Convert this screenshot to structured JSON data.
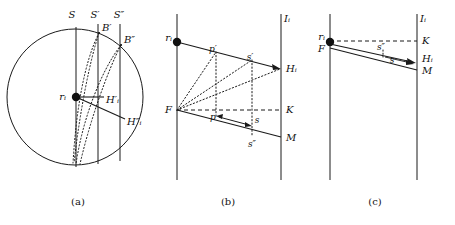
{
  "figure": {
    "background": "#ffffff",
    "stroke": "#1a1a1a",
    "panels": [
      {
        "id": "a",
        "caption": "(a)",
        "labels": {
          "center_point": "rᵢ",
          "line_S": "S",
          "line_S_prime": "S′",
          "line_S_double_prime": "S″",
          "point_B_prime": "B′",
          "point_B_double_prime": "B″",
          "point_H_prime": "H′ᵢ",
          "point_H_double_prime": "H″ᵢ"
        }
      },
      {
        "id": "b",
        "caption": "(b)",
        "labels": {
          "source_point": "rᵢ",
          "line_I": "Iᵢ",
          "point_F": "F",
          "point_K": "K",
          "point_M": "M",
          "point_H": "Hᵢ",
          "seg_p_prime": "p′",
          "seg_s_prime": "s′",
          "seg_p": "p",
          "seg_s": "s",
          "seg_s_double_prime": "s″"
        }
      },
      {
        "id": "c",
        "caption": "(c)",
        "labels": {
          "source_point": "rᵢ",
          "line_I": "Iᵢ",
          "point_F": "F",
          "point_K": "K",
          "point_M": "M",
          "point_H": "Hᵢ",
          "seg_s_double_prime": "s″",
          "seg_s": "s"
        }
      }
    ]
  }
}
